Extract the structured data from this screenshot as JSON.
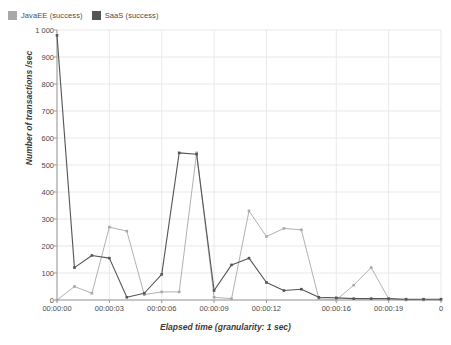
{
  "legend": {
    "position": "top-left",
    "entries": [
      {
        "label": "JavaEE (success)",
        "color": "#a8a8a8"
      },
      {
        "label": "SaaS (success)",
        "color": "#555555"
      }
    ]
  },
  "axes": {
    "y_title": "Number of transactions /sec",
    "x_title": "Elapsed time (granularity: 1 sec)",
    "y_ticks": [
      "0",
      "100",
      "200",
      "300",
      "400",
      "500",
      "600",
      "700",
      "800",
      "900",
      "1 000"
    ],
    "x_ticks": [
      "00:00:00",
      "00:00:03",
      "00:00:06",
      "00:00:09",
      "00:00:12",
      "00:00:16",
      "00:00:19",
      "0"
    ]
  },
  "chart_data": {
    "type": "line",
    "title": "",
    "subtitle": "",
    "xlabel": "Elapsed time (granularity: 1 sec)",
    "ylabel": "Number of transactions /sec",
    "ylim": [
      0,
      1000
    ],
    "ytick_step": 100,
    "grid": true,
    "legend_position": "top-left",
    "x_tick_labels": [
      "00:00:00",
      "00:00:03",
      "00:00:06",
      "00:00:09",
      "00:00:12",
      "00:00:16",
      "00:00:19",
      "0"
    ],
    "x_tick_values": [
      0,
      3,
      6,
      9,
      12,
      16,
      19,
      22
    ],
    "xlim": [
      0,
      22
    ],
    "x": [
      0,
      1,
      2,
      3,
      4,
      5,
      6,
      7,
      8,
      9,
      10,
      11,
      12,
      13,
      14,
      15,
      16,
      17,
      18,
      19,
      20,
      21,
      22
    ],
    "series": [
      {
        "name": "JavaEE (success)",
        "color": "#a8a8a8",
        "values": [
          0,
          50,
          25,
          270,
          255,
          20,
          30,
          30,
          545,
          10,
          5,
          330,
          235,
          265,
          260,
          5,
          0,
          55,
          120,
          5,
          0,
          0,
          0
        ]
      },
      {
        "name": "SaaS (success)",
        "color": "#555555",
        "values": [
          980,
          120,
          165,
          155,
          10,
          25,
          95,
          545,
          540,
          35,
          130,
          155,
          65,
          35,
          40,
          10,
          8,
          5,
          5,
          5,
          3,
          3,
          3
        ]
      }
    ]
  }
}
